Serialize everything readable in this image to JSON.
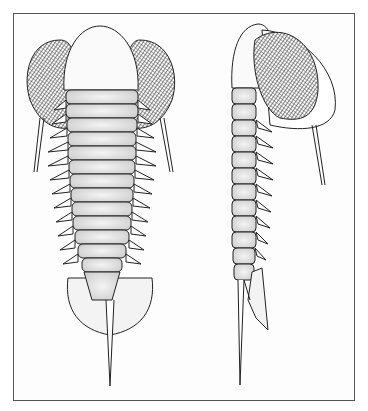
{
  "figure": {
    "views": [
      {
        "id": "dorsal",
        "label": "dorsal view"
      },
      {
        "id": "lateral",
        "label": "lateral view"
      }
    ],
    "caption": ""
  },
  "colors": {
    "ink": "#222222",
    "frame": "#555555",
    "paper": "#fdfdfd",
    "stipple": "#d9d9d9"
  }
}
